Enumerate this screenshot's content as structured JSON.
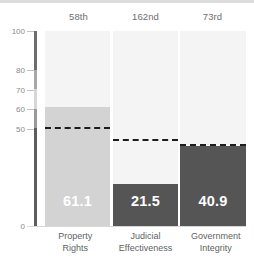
{
  "chart_data": {
    "type": "bar",
    "title": "",
    "subtitle": "",
    "xlabel": "",
    "ylabel": "",
    "ylim": [
      0,
      100
    ],
    "grid": false,
    "legend_position": "none",
    "categories": [
      "Property Rights",
      "Judicial Effectiveness",
      "Government Integrity"
    ],
    "category_lines": [
      [
        "Property",
        "Rights"
      ],
      [
        "Judicial",
        "Effectiveness"
      ],
      [
        "Government",
        "Integrity"
      ]
    ],
    "values": [
      61.1,
      21.5,
      40.9
    ],
    "value_labels": [
      "61.1",
      "21.5",
      "40.9"
    ],
    "rank_labels": [
      "58th",
      "162nd",
      "73rd"
    ],
    "world_average_lines": [
      51.0,
      44.6,
      41.8
    ],
    "bar_colors": [
      "#d3d3d3",
      "#555555",
      "#555555"
    ],
    "track_color": "#f4f4f4",
    "reference_line_color": "#1c1c1c",
    "value_label_color": "#ffffff",
    "ytick_values": [
      100,
      80,
      70,
      60,
      50,
      0
    ],
    "ytick_labels": [
      "100",
      "80",
      "70",
      "60",
      "50",
      "0"
    ],
    "axis_label_color": "#8a8a8a",
    "category_label_color": "#5f5f5f",
    "rank_label_color": "#6e6e6e"
  }
}
